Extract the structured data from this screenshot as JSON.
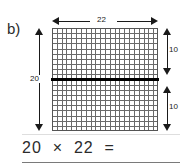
{
  "problem": {
    "label": "b)"
  },
  "figure": {
    "type": "area-model-grid",
    "grid": {
      "columns": 22,
      "rows": 20,
      "split_row": 10,
      "line_color": "#6a6a6a",
      "midline_color": "#000000"
    },
    "dimensions": {
      "top": {
        "value": "22",
        "name": "width-dimension",
        "orientation": "horizontal",
        "arrow": "double"
      },
      "left": {
        "value": "20",
        "name": "height-dimension",
        "orientation": "vertical",
        "arrow": "double"
      },
      "right_upper": {
        "value": "10",
        "name": "upper-half-dimension",
        "orientation": "vertical",
        "arrow": "double"
      },
      "right_lower": {
        "value": "10",
        "name": "lower-half-dimension",
        "orientation": "vertical",
        "arrow": "double"
      }
    }
  },
  "equation": {
    "text": "20  ×  22  =",
    "left_operand": "20",
    "operator": "×",
    "right_operand": "22",
    "equals": "=",
    "answer": ""
  },
  "colors": {
    "ink": "#2b2b2b",
    "arrow": "#1a1a1a",
    "grid_line": "#6a6a6a",
    "rule": "#7a7a7a",
    "background": "#ffffff"
  }
}
